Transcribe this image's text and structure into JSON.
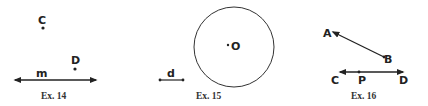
{
  "figures": [
    {
      "caption": "Ex. 14",
      "points": [
        {
          "label": "C"
        },
        {
          "label": "D"
        }
      ],
      "line": {
        "label": "m"
      }
    },
    {
      "caption": "Ex. 15",
      "center": {
        "label": "O"
      },
      "segment": {
        "label": "d"
      }
    },
    {
      "caption": "Ex. 16",
      "points": [
        {
          "label": "A"
        },
        {
          "label": "B"
        },
        {
          "label": "C"
        },
        {
          "label": "P"
        },
        {
          "label": "D"
        }
      ]
    }
  ],
  "colors": {
    "stroke": "#222222",
    "background": "#ffffff"
  }
}
